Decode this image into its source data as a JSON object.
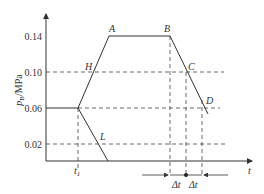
{
  "diagram": {
    "y_axis_label": "p",
    "y_axis_sub": "B",
    "y_axis_unit": "/MPa",
    "x_axis_label": "t",
    "y_ticks": [
      "0.14",
      "0.10",
      "0.06",
      "0.02"
    ],
    "points": {
      "A": "A",
      "B": "B",
      "C": "C",
      "D": "D",
      "H": "H",
      "L": "L"
    },
    "t1_label": "t",
    "t1_sub": "1",
    "delta1": "Δt",
    "delta2": "Δt"
  }
}
